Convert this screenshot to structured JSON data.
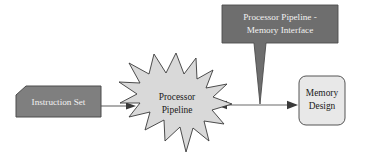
{
  "diagram": {
    "background_color": "#ffffff",
    "nodes": {
      "instruction_set": {
        "label": "Instruction Set",
        "shape": "chamfered-rectangle",
        "fill": "#7f7f7f",
        "stroke": "#4d4d4d",
        "text_color": "#f2f2f2"
      },
      "processor_pipeline": {
        "label_line1": "Processor",
        "label_line2": "Pipeline",
        "shape": "explosion-star",
        "fill": "#d9d9d9",
        "stroke": "#3a3a3a",
        "text_color": "#1a1a1a"
      },
      "memory_design": {
        "label_line1": "Memory",
        "label_line2": "Design",
        "shape": "rounded-rectangle",
        "fill": "#e8e8e8",
        "stroke": "#555555",
        "text_color": "#1a1a1a"
      },
      "callout": {
        "label_line1": "Processor Pipeline -",
        "label_line2": "Memory Interface",
        "shape": "callout-rectangle-with-tail",
        "fill": "#6e6e6e",
        "stroke": "#4d4d4d",
        "text_color": "#f2f2f2"
      }
    },
    "connectors": [
      {
        "name": "instruction-set-to-pipeline",
        "from": "instruction_set",
        "to": "processor_pipeline",
        "arrowheads": "end",
        "color": "#6b6b6b"
      },
      {
        "name": "pipeline-to-memory-design",
        "from": "processor_pipeline",
        "to": "memory_design",
        "arrowheads": "both",
        "color": "#6b6b6b"
      },
      {
        "name": "callout-tail-to-connector",
        "from": "callout",
        "to": "pipeline-to-memory-design",
        "arrowheads": "none",
        "color": "#6e6e6e"
      }
    ]
  }
}
